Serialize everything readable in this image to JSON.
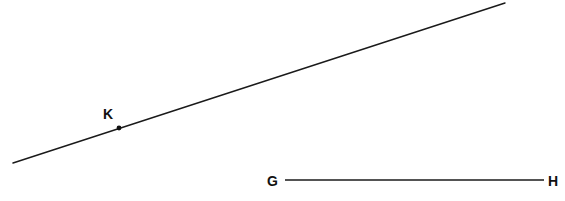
{
  "figure": {
    "background": "#ffffff",
    "stroke_color": "#1a1a1a",
    "line_kl": {
      "x1": 13,
      "y1": 163,
      "x2": 505,
      "y2": 3
    },
    "point_k": {
      "label": "K",
      "x": 119,
      "y": 128,
      "label_x": 103,
      "label_y": 119
    },
    "segment_gh": {
      "x1": 285,
      "y1": 180,
      "x2": 544,
      "y2": 180,
      "start_label": "G",
      "start_label_x": 267,
      "start_label_y": 186,
      "end_label": "H",
      "end_label_x": 548,
      "end_label_y": 186
    }
  }
}
